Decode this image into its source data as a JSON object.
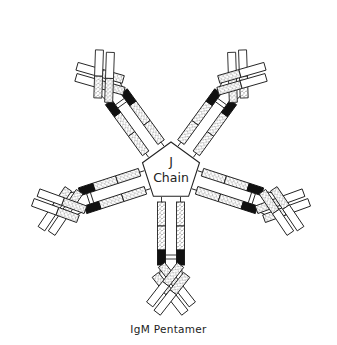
{
  "diagram": {
    "title": "IgM Pentamer",
    "center_label_line1": "J",
    "center_label_line2": "Chain",
    "monomer_count": 5,
    "parts": {
      "center": "J chain (pentagon)",
      "heavy_chain_constant": "stippled segments",
      "hinge": "black segment",
      "variable_region": "white segments",
      "light_chain": "parallel short chain on each Fab arm"
    },
    "colors": {
      "outline": "#222222",
      "hinge": "#111111",
      "background": "#ffffff"
    }
  }
}
